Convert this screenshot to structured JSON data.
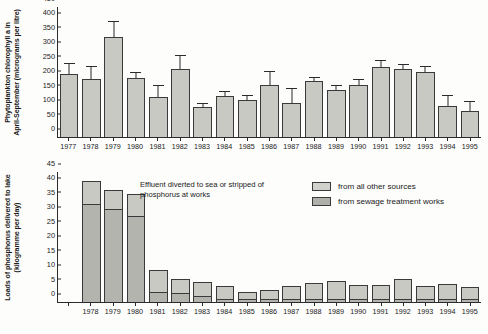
{
  "chart_data": [
    {
      "type": "bar",
      "panel": "top",
      "title": "",
      "xlabel": "",
      "ylabel": "Phytoplankton chlorophyll a in April-September (micrograms per litre)",
      "ylim": [
        0,
        450
      ],
      "yticks": [
        0,
        50,
        100,
        150,
        200,
        250,
        300,
        350,
        400,
        450
      ],
      "grid": false,
      "error_bars": "upper only",
      "categories": [
        "1977",
        "1978",
        "1979",
        "1980",
        "1981",
        "1982",
        "1983",
        "1984",
        "1985",
        "1986",
        "1987",
        "1988",
        "1989",
        "1990",
        "1991",
        "1992",
        "1993",
        "1994",
        "1995"
      ],
      "values": [
        215,
        200,
        343,
        203,
        138,
        232,
        102,
        142,
        127,
        180,
        118,
        192,
        163,
        178,
        240,
        232,
        222,
        105,
        88
      ],
      "error_upper": [
        253,
        243,
        400,
        222,
        178,
        283,
        118,
        157,
        143,
        228,
        170,
        205,
        180,
        198,
        263,
        252,
        245,
        143,
        123
      ]
    },
    {
      "type": "bar",
      "panel": "bottom",
      "stacked": true,
      "title": "",
      "xlabel": "",
      "ylabel": "Loads of phosphorus delivered to lake (kilogramme per day)",
      "ylim": [
        0,
        45
      ],
      "yticks": [
        0,
        5,
        10,
        15,
        20,
        25,
        30,
        35,
        40,
        45
      ],
      "grid": false,
      "categories": [
        "1978",
        "1979",
        "1980",
        "1981",
        "1982",
        "1983",
        "1984",
        "1985",
        "1986",
        "1987",
        "1988",
        "1989",
        "1990",
        "1991",
        "1992",
        "1993",
        "1994",
        "1995"
      ],
      "series": [
        {
          "name": "from sewage treatment works",
          "values": [
            33.8,
            31.8,
            29.5,
            3.5,
            3.0,
            2.0,
            1.2,
            1.0,
            1.0,
            1.1,
            1.2,
            1.2,
            1.1,
            1.1,
            1.2,
            1.1,
            1.1,
            1.1
          ]
        },
        {
          "name": "from all other sources",
          "values": [
            7.7,
            6.7,
            7.5,
            7.5,
            5.0,
            5.0,
            4.3,
            2.3,
            3.1,
            4.5,
            5.2,
            6.0,
            4.6,
            4.7,
            6.6,
            4.5,
            5.0,
            3.9
          ]
        }
      ],
      "totals": [
        41.5,
        38.5,
        37.0,
        11.0,
        8.0,
        7.0,
        5.5,
        3.3,
        4.1,
        5.6,
        6.4,
        7.2,
        5.7,
        5.8,
        7.8,
        5.6,
        6.1,
        5.0
      ]
    }
  ],
  "top": {
    "ytitle": "Phytoplankton chlorophyll a in\nApril-September (micrograms per litre)",
    "ytitle_line1": "Phytoplankton chlorophyll a in",
    "ytitle_line2": "April-September (micrograms per litre)"
  },
  "bottom": {
    "ytitle_line1": "Loads of phosphorus delivered to lake",
    "ytitle_line2": "(kilogramme per day)",
    "annotation_line1": "Effluent diverted to sea or stripped of",
    "annotation_line2": "phosphorus at works"
  },
  "legend": {
    "items": [
      {
        "label": "from all other sources",
        "color": "#d2d2cd"
      },
      {
        "label": "from sewage treatment works",
        "color": "#b0b0aa"
      }
    ]
  }
}
